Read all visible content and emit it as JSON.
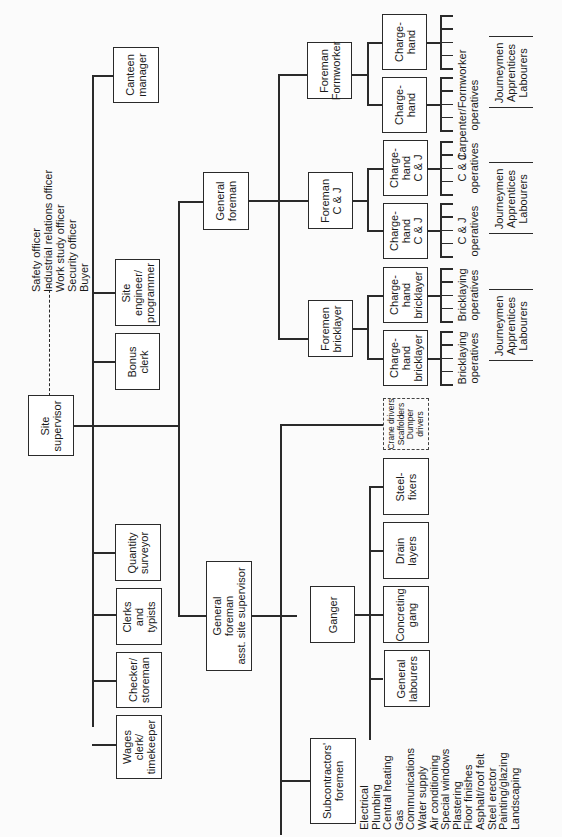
{
  "chart_data": {
    "type": "org-chart",
    "orientation": "rotated 90deg counter-clockwise (text reads bottom-to-top)",
    "root": "Site supervisor",
    "staff_dashed": [
      "Safety officer",
      "Industrial relations officer",
      "Work study officer",
      "Security officer",
      "Buyer"
    ]
  },
  "root": {
    "label": [
      "Site",
      "supervisor"
    ]
  },
  "staff_list": [
    "Safety officer",
    "Industrial relations officer",
    "Work study officer",
    "Security officer",
    "Buyer"
  ],
  "staff_boxes": {
    "canteen": [
      "Canteen",
      "manager"
    ],
    "site_engineer": [
      "Site",
      "engineer/",
      "programmer"
    ],
    "bonus_clerk": [
      "Bonus",
      "clerk"
    ],
    "quantity_surveyor": [
      "Quantity",
      "surveyor"
    ],
    "clerks": [
      "Clerks",
      "and",
      "typists"
    ],
    "checker": [
      "Checker/",
      "storeman"
    ],
    "wages": [
      "Wages",
      "clerk/",
      "timekeeper"
    ]
  },
  "general_foreman": {
    "label": [
      "General",
      "foreman"
    ]
  },
  "asst_foreman": {
    "label": [
      "General",
      "foreman",
      "asst. site supervisor"
    ]
  },
  "foremen": {
    "formworker": [
      "Foreman",
      "Formworker"
    ],
    "cj": [
      "Foreman",
      "C & J"
    ],
    "bricklayer": [
      "Foremen",
      "bricklayer"
    ]
  },
  "chargehands": {
    "form1": [
      "Charge-",
      "hand"
    ],
    "form2": [
      "Charge-",
      "hand"
    ],
    "cj1": [
      "Charge-",
      "hand",
      "C & J"
    ],
    "cj2": [
      "Charge-",
      "hand",
      "C & J"
    ],
    "brick1": [
      "Charge-",
      "hand",
      "bricklayer"
    ],
    "brick2": [
      "Charge-",
      "hand",
      "bricklayer"
    ]
  },
  "operatives": {
    "form": [
      "Carpenter/Formworker",
      "operatives"
    ],
    "cj1": [
      "C & J",
      "operatives"
    ],
    "cj2": [
      "C & J",
      "operatives"
    ],
    "brick1": [
      "Bricklaying",
      "operatives"
    ],
    "brick2": [
      "Bricklaying",
      "operatives"
    ]
  },
  "grades": [
    "Journeymen",
    "Apprentices",
    "Labourers"
  ],
  "ganger": {
    "label": [
      "Ganger"
    ]
  },
  "gangs": {
    "steel": [
      "Steel-",
      "fixers"
    ],
    "drain": [
      "Drain",
      "layers"
    ],
    "concrete": [
      "Concreting",
      "gang"
    ],
    "labourers": [
      "General",
      "labourers"
    ]
  },
  "plant": [
    "Crane drivers",
    "Scaffolders",
    "Dumper",
    "drivers"
  ],
  "subcontractors": {
    "label": [
      "Subcontractors'",
      "foremen"
    ],
    "trades": [
      "Electrical",
      "Plumbing",
      "Central heating",
      "Gas",
      "Communications",
      "Water supply",
      "Air conditioning",
      "Special windows",
      "Plastering",
      "Floor finishes",
      "Asphalt/roof felt",
      "Steel erector",
      "Painting/glazing",
      "Landscaping"
    ]
  }
}
